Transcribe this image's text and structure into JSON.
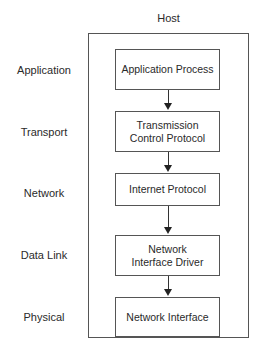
{
  "diagram": {
    "title": "Host",
    "layers": [
      {
        "label": "Application",
        "component": "Application Process"
      },
      {
        "label": "Transport",
        "component": "Transmission Control Protocol"
      },
      {
        "label": "Network",
        "component": "Internet Protocol"
      },
      {
        "label": "Data Link",
        "component": "Network Interface Driver"
      },
      {
        "label": "Physical",
        "component": "Network Interface"
      }
    ],
    "edges": [
      {
        "from": "Application Process",
        "to": "Transmission Control Protocol"
      },
      {
        "from": "Transmission Control Protocol",
        "to": "Internet Protocol"
      },
      {
        "from": "Internet Protocol",
        "to": "Network Interface Driver"
      },
      {
        "from": "Network Interface Driver",
        "to": "Network Interface"
      }
    ]
  }
}
